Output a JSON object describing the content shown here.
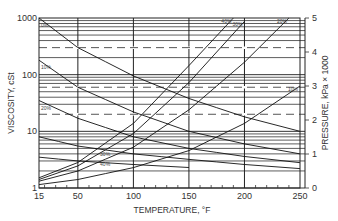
{
  "chart_data": {
    "type": "line",
    "title": "",
    "xlabel": "TEMPERATURE, °F",
    "ylabel_left": "VISCOSITY, cSt",
    "ylabel_right": "PRESSURE, kPa × 1000",
    "x_ticks": [
      "15",
      "50",
      "100",
      "150",
      "200",
      "250"
    ],
    "x_range": [
      15,
      250
    ],
    "y_left_ticks": [
      "1",
      "10",
      "100",
      "1000"
    ],
    "y_left_range": [
      1,
      1000
    ],
    "y_left_scale": "log",
    "y_right_ticks": [
      "0",
      "1",
      "2",
      "3",
      "4",
      "5"
    ],
    "y_right_range": [
      0,
      5
    ],
    "grid": true,
    "series": [
      {
        "name": "Viscosity 0%",
        "axis": "left",
        "label": "0%",
        "x": [
          15,
          50,
          100,
          150,
          200,
          250
        ],
        "values": [
          1000,
          300,
          95,
          38,
          18,
          10
        ]
      },
      {
        "name": "Viscosity 10%",
        "axis": "left",
        "label": "10%",
        "x": [
          15,
          50,
          100,
          150,
          200,
          250
        ],
        "values": [
          180,
          60,
          22,
          10,
          6,
          4
        ]
      },
      {
        "name": "Viscosity 20%",
        "axis": "left",
        "label": "20%",
        "x": [
          15,
          50,
          100,
          150,
          200,
          250
        ],
        "values": [
          35,
          17,
          8,
          5,
          3.6,
          2.8
        ]
      },
      {
        "name": "Viscosity 30%",
        "axis": "left",
        "label": "30%",
        "x": [
          15,
          50,
          100,
          150,
          200,
          250
        ],
        "values": [
          8,
          5.5,
          4,
          3.2,
          2.6,
          2.2
        ]
      },
      {
        "name": "Viscosity 40%",
        "axis": "left",
        "label": "40%",
        "x": [
          15,
          50,
          100,
          150
        ],
        "values": [
          3.5,
          3,
          2.6,
          2.3
        ]
      },
      {
        "name": "Pressure 10%",
        "axis": "right",
        "label": "10%",
        "x": [
          15,
          50,
          100,
          150,
          200,
          250
        ],
        "values": [
          0.1,
          0.25,
          0.6,
          1.1,
          1.9,
          3.0
        ]
      },
      {
        "name": "Pressure 20%",
        "axis": "right",
        "label": "20%",
        "x": [
          15,
          50,
          100,
          150,
          200,
          240
        ],
        "values": [
          0.2,
          0.5,
          1.2,
          2.3,
          3.7,
          5.0
        ]
      },
      {
        "name": "Pressure 30%",
        "axis": "right",
        "label": "30%",
        "x": [
          15,
          50,
          100,
          150,
          200
        ],
        "values": [
          0.25,
          0.65,
          1.6,
          3.1,
          4.9
        ]
      },
      {
        "name": "Pressure 40%",
        "axis": "right",
        "label": "40%",
        "x": [
          15,
          50,
          100,
          150,
          190
        ],
        "values": [
          0.3,
          0.75,
          1.9,
          3.6,
          5.0
        ]
      }
    ],
    "reference_lines": [
      {
        "style": "dashed",
        "left_value": 300
      },
      {
        "style": "dashed",
        "left_value": 60
      },
      {
        "style": "dashed",
        "left_value": 20
      }
    ]
  }
}
